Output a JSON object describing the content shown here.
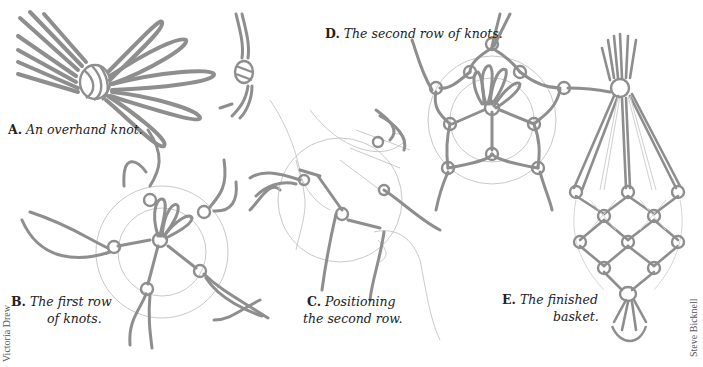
{
  "figure": {
    "panels": [
      {
        "id": "A",
        "letter": "A.",
        "caption_line1": "An overhand knot.",
        "caption_line2": ""
      },
      {
        "id": "B",
        "letter": "B.",
        "caption_line1": "The first row",
        "caption_line2": "of knots."
      },
      {
        "id": "C",
        "letter": "C.",
        "caption_line1": "Positioning",
        "caption_line2": "the second row."
      },
      {
        "id": "D",
        "letter": "D.",
        "caption_line1": "The second row of knots.",
        "caption_line2": ""
      },
      {
        "id": "E",
        "letter": "E.",
        "caption_line1": "The finished",
        "caption_line2": "basket."
      }
    ],
    "credits": {
      "left": "Victoria Drew",
      "right": "Steve Bicknell"
    },
    "colors": {
      "rope": "#8e8e8e",
      "guide_circle": "#c9c9c9",
      "background": "#ffffff",
      "text": "#222222"
    }
  }
}
